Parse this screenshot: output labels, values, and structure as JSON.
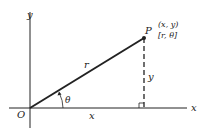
{
  "diagram": {
    "axes": {
      "x_label": "x",
      "y_label": "y",
      "origin_label": "O"
    },
    "point": {
      "name": "P",
      "cartesian": "(x, y)",
      "polar": "[r, θ]"
    },
    "segments": {
      "radius_label": "r",
      "horizontal_label": "x",
      "vertical_label": "y",
      "angle_label": "θ"
    },
    "colors": {
      "ink": "#222222",
      "background": "#ffffff"
    }
  }
}
